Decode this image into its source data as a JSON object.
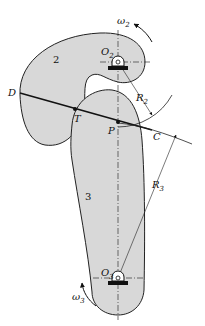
{
  "figure": {
    "type": "cam-follower contact diagram",
    "colors": {
      "body_fill": "#d8d8d8",
      "outline": "#222222",
      "line": "#111111",
      "background": "#ffffff"
    }
  },
  "bodies": [
    {
      "id": "body-2",
      "label": "2"
    },
    {
      "id": "body-3",
      "label": "3"
    }
  ],
  "pivots": [
    {
      "id": "O2",
      "label": "O",
      "sub": "2"
    },
    {
      "id": "O3",
      "label": "O",
      "sub": "3"
    }
  ],
  "points": [
    {
      "id": "D",
      "label": "D"
    },
    {
      "id": "T",
      "label": "T"
    },
    {
      "id": "P",
      "label": "P"
    },
    {
      "id": "C",
      "label": "C"
    }
  ],
  "radii": [
    {
      "id": "R2",
      "label": "R",
      "sub": "2"
    },
    {
      "id": "R3",
      "label": "R",
      "sub": "3"
    }
  ],
  "angular_velocities": [
    {
      "id": "omega2",
      "label": "ω",
      "sub": "2"
    },
    {
      "id": "omega3",
      "label": "ω",
      "sub": "3"
    }
  ]
}
